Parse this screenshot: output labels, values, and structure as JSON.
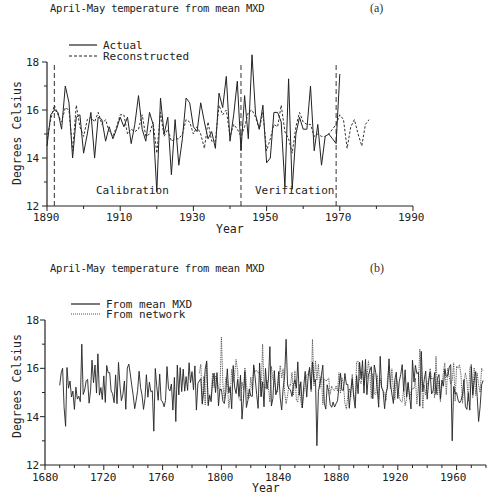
{
  "chart_data": [
    {
      "panel": "(a)",
      "type": "line",
      "title": "April-May temperature from mean MXD",
      "xlabel": "Year",
      "ylabel": "Degrees Celsius",
      "xlim": [
        1890,
        1990
      ],
      "ylim": [
        12,
        18
      ],
      "xticks": [
        1890,
        1910,
        1930,
        1950,
        1970,
        1990
      ],
      "yticks": [
        12,
        14,
        16,
        18
      ],
      "grid": false,
      "legend_position": "top-left",
      "annotations": [
        {
          "text": "Calibration",
          "x": 1915,
          "y": 12.6
        },
        {
          "text": "Verification",
          "x": 1955,
          "y": 12.6
        }
      ],
      "vlines": [
        1892,
        1943,
        1969
      ],
      "series": [
        {
          "name": "Actual",
          "style": "solid",
          "x": [
            1890,
            1891,
            1892,
            1893,
            1894,
            1895,
            1896,
            1897,
            1898,
            1899,
            1900,
            1901,
            1902,
            1903,
            1904,
            1905,
            1906,
            1907,
            1908,
            1909,
            1910,
            1911,
            1912,
            1913,
            1914,
            1915,
            1916,
            1917,
            1918,
            1919,
            1920,
            1921,
            1922,
            1923,
            1924,
            1925,
            1926,
            1927,
            1928,
            1929,
            1930,
            1931,
            1932,
            1933,
            1934,
            1935,
            1936,
            1937,
            1938,
            1939,
            1940,
            1941,
            1942,
            1943,
            1944,
            1945,
            1946,
            1947,
            1948,
            1949,
            1950,
            1951,
            1952,
            1953,
            1954,
            1955,
            1956,
            1957,
            1958,
            1959,
            1960,
            1961,
            1962,
            1963,
            1964,
            1965,
            1966,
            1967,
            1968,
            1969,
            1970
          ],
          "values": [
            14.5,
            15.8,
            16.0,
            15.9,
            15.2,
            17.0,
            16.3,
            14.0,
            15.7,
            15.8,
            14.2,
            15.0,
            15.9,
            14.0,
            15.7,
            15.6,
            14.7,
            15.3,
            14.8,
            15.2,
            15.7,
            15.3,
            15.7,
            14.6,
            15.4,
            16.6,
            15.2,
            14.7,
            15.9,
            15.4,
            12.6,
            16.5,
            15.0,
            15.7,
            13.3,
            15.6,
            13.7,
            14.8,
            16.5,
            16.3,
            15.3,
            15.1,
            16.3,
            15.5,
            14.8,
            15.1,
            14.4,
            16.7,
            16.1,
            17.4,
            14.7,
            15.8,
            17.2,
            14.3,
            16.6,
            14.8,
            18.3,
            15.8,
            15.2,
            16.2,
            13.8,
            14.0,
            15.9,
            15.9,
            15.5,
            12.8,
            17.3,
            12.7,
            15.0,
            15.7,
            15.2,
            15.2,
            17.0,
            14.3,
            15.4,
            13.7,
            14.9,
            15.0,
            14.8,
            14.6,
            17.5
          ]
        },
        {
          "name": "Reconstructed",
          "style": "dashed",
          "x": [
            1890,
            1891,
            1892,
            1893,
            1894,
            1895,
            1896,
            1897,
            1898,
            1899,
            1900,
            1901,
            1902,
            1903,
            1904,
            1905,
            1906,
            1907,
            1908,
            1909,
            1910,
            1911,
            1912,
            1913,
            1914,
            1915,
            1916,
            1917,
            1918,
            1919,
            1920,
            1921,
            1922,
            1923,
            1924,
            1925,
            1926,
            1927,
            1928,
            1929,
            1930,
            1931,
            1932,
            1933,
            1934,
            1935,
            1936,
            1937,
            1938,
            1939,
            1940,
            1941,
            1942,
            1943,
            1944,
            1945,
            1946,
            1947,
            1948,
            1949,
            1950,
            1951,
            1952,
            1953,
            1954,
            1955,
            1956,
            1957,
            1958,
            1959,
            1960,
            1961,
            1962,
            1963,
            1964,
            1965,
            1966,
            1967,
            1968,
            1969,
            1970,
            1971,
            1972,
            1973,
            1974,
            1975,
            1976,
            1977,
            1978
          ],
          "values": [
            14.8,
            15.6,
            16.2,
            15.8,
            15.5,
            16.1,
            16.0,
            14.3,
            16.2,
            15.3,
            14.9,
            15.6,
            15.7,
            15.5,
            15.9,
            15.4,
            15.6,
            15.1,
            14.9,
            15.3,
            15.8,
            15.8,
            15.0,
            15.2,
            15.1,
            15.2,
            15.8,
            14.9,
            15.0,
            15.5,
            14.2,
            15.9,
            14.9,
            15.2,
            14.7,
            14.8,
            14.8,
            15.0,
            15.6,
            15.5,
            15.0,
            15.3,
            15.0,
            14.4,
            15.5,
            14.7,
            14.7,
            16.2,
            15.8,
            16.0,
            14.9,
            15.4,
            15.2,
            14.9,
            15.3,
            15.9,
            16.0,
            15.7,
            15.2,
            15.9,
            14.3,
            14.8,
            15.4,
            15.3,
            16.2,
            15.1,
            14.8,
            14.2,
            15.3,
            15.9,
            15.5,
            15.4,
            15.4,
            14.9,
            15.0,
            14.9,
            14.9,
            15.0,
            15.2,
            15.4,
            15.8,
            15.6,
            14.4,
            15.3,
            15.6,
            15.0,
            14.5,
            15.4,
            15.6
          ]
        }
      ]
    },
    {
      "panel": "(b)",
      "type": "line",
      "title": "April-May temperature from mean MXD",
      "xlabel": "Year",
      "ylabel": "Degrees Celsius",
      "xlim": [
        1680,
        1980
      ],
      "ylim": [
        12,
        18
      ],
      "xticks": [
        1680,
        1720,
        1760,
        1800,
        1840,
        1880,
        1920,
        1960
      ],
      "yticks": [
        12,
        14,
        16,
        18
      ],
      "grid": false,
      "legend_position": "top-left",
      "series": [
        {
          "name": "From mean MXD",
          "style": "solid",
          "x_range": [
            1690,
            1978
          ],
          "values_summary": {
            "min": 12.8,
            "max": 17.3,
            "approx_mean": 15.3
          },
          "notable_points": [
            {
              "x": 1690,
              "y": 15.3
            },
            {
              "x": 1692,
              "y": 16.0
            },
            {
              "x": 1694,
              "y": 13.6
            },
            {
              "x": 1700,
              "y": 14.3
            },
            {
              "x": 1705,
              "y": 17.0
            },
            {
              "x": 1716,
              "y": 16.6
            },
            {
              "x": 1754,
              "y": 13.4
            },
            {
              "x": 1769,
              "y": 13.8
            },
            {
              "x": 1814,
              "y": 13.9
            },
            {
              "x": 1833,
              "y": 16.9
            },
            {
              "x": 1844,
              "y": 17.2
            },
            {
              "x": 1865,
              "y": 12.8
            },
            {
              "x": 1908,
              "y": 16.5
            },
            {
              "x": 1936,
              "y": 16.7
            },
            {
              "x": 1957,
              "y": 13.0
            },
            {
              "x": 1975,
              "y": 13.8
            },
            {
              "x": 1978,
              "y": 15.5
            }
          ]
        },
        {
          "name": "From network",
          "style": "dotted",
          "x_range": [
            1785,
            1978
          ],
          "values_summary": {
            "min": 13.5,
            "max": 17.3,
            "approx_mean": 15.3
          },
          "notable_points": [
            {
              "x": 1785,
              "y": 15.8
            },
            {
              "x": 1800,
              "y": 17.3
            },
            {
              "x": 1828,
              "y": 17.0
            },
            {
              "x": 1838,
              "y": 15.0
            },
            {
              "x": 1852,
              "y": 14.6
            },
            {
              "x": 1862,
              "y": 17.2
            },
            {
              "x": 1893,
              "y": 16.3
            },
            {
              "x": 1935,
              "y": 16.8
            },
            {
              "x": 1946,
              "y": 16.5
            },
            {
              "x": 1977,
              "y": 16.0
            }
          ]
        }
      ]
    }
  ],
  "panels": {
    "a": {
      "title": "April-May temperature from mean MXD",
      "label": "(a)",
      "legend": [
        "Actual",
        "Reconstructed"
      ],
      "ylabel": "Degrees Celsius",
      "xlabel": "Year",
      "xticks": [
        "1890",
        "1910",
        "1930",
        "1950",
        "1970",
        "1990"
      ],
      "yticks": [
        "12",
        "14",
        "16",
        "18"
      ],
      "annotations": {
        "calibration": "Calibration",
        "verification": "Verification"
      }
    },
    "b": {
      "title": "April-May temperature from mean MXD",
      "label": "(b)",
      "legend": [
        "From mean MXD",
        "From network"
      ],
      "ylabel": "Degrees Celsius",
      "xlabel": "Year",
      "xticks": [
        "1680",
        "1720",
        "1760",
        "1800",
        "1840",
        "1880",
        "1920",
        "1960"
      ],
      "yticks": [
        "12",
        "14",
        "16",
        "18"
      ]
    }
  }
}
